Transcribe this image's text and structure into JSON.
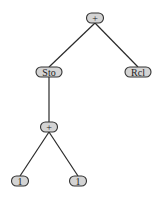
{
  "diagram": {
    "type": "expression-tree",
    "colors": {
      "node_fill": "#d4d4d4",
      "node_stroke": "#333333",
      "edge": "#2a2a2a",
      "background": "#ffffff"
    },
    "nodes": [
      {
        "id": "n0",
        "label": "+",
        "x": 95,
        "y": 18,
        "w": 17,
        "h": 10
      },
      {
        "id": "n1",
        "label": "Sto",
        "x": 49,
        "y": 72,
        "w": 26,
        "h": 10
      },
      {
        "id": "n2",
        "label": "Rcl",
        "x": 138,
        "y": 72,
        "w": 26,
        "h": 10
      },
      {
        "id": "n3",
        "label": "+",
        "x": 49,
        "y": 127,
        "w": 17,
        "h": 10
      },
      {
        "id": "n4",
        "label": "1",
        "x": 20,
        "y": 181,
        "w": 17,
        "h": 10
      },
      {
        "id": "n5",
        "label": "1",
        "x": 78,
        "y": 181,
        "w": 17,
        "h": 10
      }
    ],
    "edges": [
      {
        "from": "n0",
        "to": "n1"
      },
      {
        "from": "n0",
        "to": "n2"
      },
      {
        "from": "n1",
        "to": "n3"
      },
      {
        "from": "n3",
        "to": "n4"
      },
      {
        "from": "n3",
        "to": "n5"
      }
    ]
  }
}
